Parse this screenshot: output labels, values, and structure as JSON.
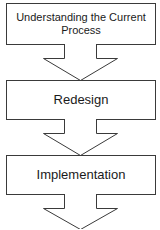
{
  "diagram": {
    "type": "process-flow",
    "direction": "top-to-bottom",
    "colors": {
      "stroke": "#3a3a3a",
      "fill": "#ffffff",
      "text": "#1a1a1a"
    },
    "steps": [
      {
        "label": "Understanding the Current Process"
      },
      {
        "label": "Redesign"
      },
      {
        "label": "Implementation"
      }
    ],
    "connectors": [
      {
        "from": 0,
        "to": 1,
        "shape": "block-arrow-down"
      },
      {
        "from": 1,
        "to": 2,
        "shape": "block-arrow-down"
      },
      {
        "from": 2,
        "to": null,
        "shape": "block-arrow-down"
      }
    ]
  }
}
